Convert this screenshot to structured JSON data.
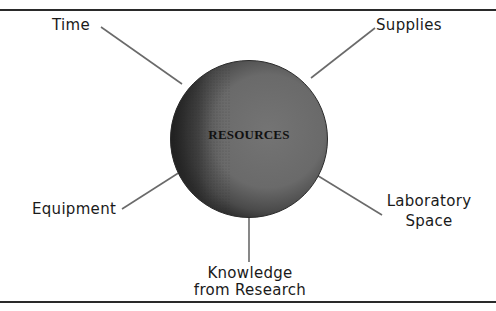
{
  "diagram": {
    "center": {
      "label": "RESOURCES",
      "fill_color": "#6e6e6e",
      "shadow_color": "#2e2e2e"
    },
    "nodes": [
      {
        "id": "time",
        "label": "Time"
      },
      {
        "id": "supplies",
        "label": "Supplies"
      },
      {
        "id": "equipment",
        "label": "Equipment"
      },
      {
        "id": "laboratory-space",
        "label_line1": "Laboratory",
        "label_line2": "Space"
      },
      {
        "id": "knowledge",
        "label_line1": "Knowledge",
        "label_line2": "from Research"
      }
    ],
    "connector_color": "#6a6a6a",
    "rule_color": "#2a2a2a"
  }
}
